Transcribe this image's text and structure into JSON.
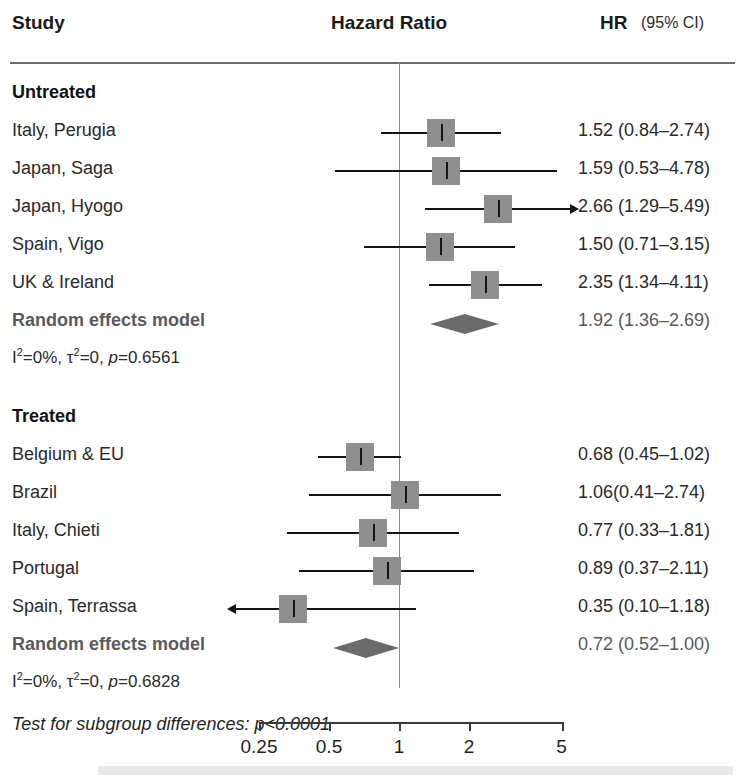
{
  "header": {
    "study_label": "Study",
    "plot_label": "Hazard Ratio",
    "hr_label": "HR",
    "ci_label": "(95% CI)"
  },
  "subgroup_test": "Test for subgroup differences: p<0.0001",
  "axis": {
    "ticks": [
      "0.25",
      "0.5",
      "1",
      "2",
      "5"
    ],
    "tick_values": [
      0.25,
      0.5,
      1,
      2,
      5
    ]
  },
  "groups": [
    {
      "name": "Untreated",
      "heterogeneity": {
        "i2_label": "I",
        "i2_sup": "2",
        "i2_value": "=0%,",
        "tau_label": "τ",
        "tau_sup": "2",
        "tau_value": "=0,",
        "p_label": "p",
        "p_value": "=0.6561"
      },
      "pooled": {
        "label": "Random effects model",
        "value": "1.92 (1.36–2.69)",
        "hr": 1.92,
        "lo": 1.36,
        "hi": 2.69
      },
      "studies": [
        {
          "label": "Italy, Perugia",
          "value": "1.52 (0.84–2.74)",
          "hr": 1.52,
          "lo": 0.84,
          "hi": 2.74,
          "clip_lo": false,
          "clip_hi": false
        },
        {
          "label": "Japan, Saga",
          "value": "1.59 (0.53–4.78)",
          "hr": 1.59,
          "lo": 0.53,
          "hi": 4.78,
          "clip_lo": false,
          "clip_hi": false
        },
        {
          "label": "Japan, Hyogo",
          "value": "2.66 (1.29–5.49)",
          "hr": 2.66,
          "lo": 1.29,
          "hi": 5.49,
          "clip_lo": false,
          "clip_hi": true
        },
        {
          "label": "Spain, Vigo",
          "value": "1.50 (0.71–3.15)",
          "hr": 1.5,
          "lo": 0.71,
          "hi": 3.15,
          "clip_lo": false,
          "clip_hi": false
        },
        {
          "label": "UK & Ireland",
          "value": "2.35 (1.34–4.11)",
          "hr": 2.35,
          "lo": 1.34,
          "hi": 4.11,
          "clip_lo": false,
          "clip_hi": false
        }
      ]
    },
    {
      "name": "Treated",
      "heterogeneity": {
        "i2_label": "I",
        "i2_sup": "2",
        "i2_value": "=0%,",
        "tau_label": "τ",
        "tau_sup": "2",
        "tau_value": "=0,",
        "p_label": "p",
        "p_value": "=0.6828"
      },
      "pooled": {
        "label": "Random effects model",
        "value": "0.72 (0.52–1.00)",
        "hr": 0.72,
        "lo": 0.52,
        "hi": 1.0
      },
      "studies": [
        {
          "label": "Belgium & EU",
          "value": "0.68 (0.45–1.02)",
          "hr": 0.68,
          "lo": 0.45,
          "hi": 1.02,
          "clip_lo": false,
          "clip_hi": false
        },
        {
          "label": "Brazil",
          "value": "1.06(0.41–2.74)",
          "hr": 1.06,
          "lo": 0.41,
          "hi": 2.74,
          "clip_lo": false,
          "clip_hi": false
        },
        {
          "label": "Italy, Chieti",
          "value": "0.77 (0.33–1.81)",
          "hr": 0.77,
          "lo": 0.33,
          "hi": 1.81,
          "clip_lo": false,
          "clip_hi": false
        },
        {
          "label": "Portugal",
          "value": "0.89 (0.37–2.11)",
          "hr": 0.89,
          "lo": 0.37,
          "hi": 2.11,
          "clip_lo": false,
          "clip_hi": false
        },
        {
          "label": "Spain, Terrassa",
          "value": "0.35 (0.10–1.18)",
          "hr": 0.35,
          "lo": 0.1,
          "hi": 1.18,
          "clip_lo": true,
          "clip_hi": false
        }
      ]
    }
  ],
  "chart_data": {
    "type": "forest",
    "title": "Hazard Ratio",
    "xlabel": "",
    "scale": "log",
    "xlim": [
      0.22,
      5.8
    ],
    "reference_line": 1,
    "axis_ticks": [
      0.25,
      0.5,
      1,
      2,
      5
    ],
    "columns": [
      "Study",
      "Hazard Ratio",
      "HR",
      "(95% CI)"
    ],
    "subgroup_test": "Test for subgroup differences: p<0.0001",
    "subgroups": [
      {
        "name": "Untreated",
        "i_squared": "0%",
        "tau_squared": "0",
        "p": "0.6561",
        "pooled_estimate": {
          "label": "Random effects model",
          "hr": 1.92,
          "ci_low": 1.36,
          "ci_high": 2.69
        },
        "rows": [
          {
            "study": "Italy, Perugia",
            "hr": 1.52,
            "ci_low": 0.84,
            "ci_high": 2.74
          },
          {
            "study": "Japan, Saga",
            "hr": 1.59,
            "ci_low": 0.53,
            "ci_high": 4.78
          },
          {
            "study": "Japan, Hyogo",
            "hr": 2.66,
            "ci_low": 1.29,
            "ci_high": 5.49
          },
          {
            "study": "Spain, Vigo",
            "hr": 1.5,
            "ci_low": 0.71,
            "ci_high": 3.15
          },
          {
            "study": "UK & Ireland",
            "hr": 2.35,
            "ci_low": 1.34,
            "ci_high": 4.11
          }
        ]
      },
      {
        "name": "Treated",
        "i_squared": "0%",
        "tau_squared": "0",
        "p": "0.6828",
        "pooled_estimate": {
          "label": "Random effects model",
          "hr": 0.72,
          "ci_low": 0.52,
          "ci_high": 1.0
        },
        "rows": [
          {
            "study": "Belgium & EU",
            "hr": 0.68,
            "ci_low": 0.45,
            "ci_high": 1.02
          },
          {
            "study": "Brazil",
            "hr": 1.06,
            "ci_low": 0.41,
            "ci_high": 2.74
          },
          {
            "study": "Italy, Chieti",
            "hr": 0.77,
            "ci_low": 0.33,
            "ci_high": 1.81
          },
          {
            "study": "Portugal",
            "hr": 0.89,
            "ci_low": 0.37,
            "ci_high": 2.11
          },
          {
            "study": "Spain, Terrassa",
            "hr": 0.35,
            "ci_low": 0.1,
            "ci_high": 1.18
          }
        ]
      }
    ]
  }
}
